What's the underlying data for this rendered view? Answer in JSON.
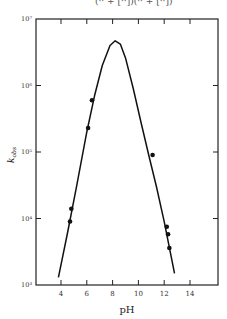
{
  "header": {
    "cropped_equation": "(·· + [··])(·· + [··])"
  },
  "chart_data": {
    "type": "line",
    "title": "",
    "xlabel": "pH",
    "ylabel": "k_obs",
    "xlim": [
      2.2,
      16
    ],
    "ylim": [
      1000,
      10000000
    ],
    "yscale": "log",
    "xticks": [
      4,
      6,
      8,
      10,
      12,
      14
    ],
    "yticks": [
      1000,
      10000,
      100000,
      1000000,
      10000000
    ],
    "ytick_labels": [
      "10³",
      "10⁴",
      "10⁵",
      "10⁶",
      "10⁷"
    ],
    "grid": false,
    "series": [
      {
        "name": "fit",
        "kind": "line",
        "x": [
          3.8,
          4.5,
          5.2,
          6.0,
          6.6,
          7.2,
          7.8,
          8.2,
          8.6,
          9.0,
          9.6,
          10.2,
          10.8,
          11.4,
          12.0,
          12.8
        ],
        "y": [
          1300,
          6000,
          30000,
          200000,
          700000,
          2000000,
          4000000,
          4700000,
          4200000,
          2600000,
          900000,
          280000,
          90000,
          30000,
          9000,
          1500
        ]
      },
      {
        "name": "data",
        "kind": "scatter",
        "x": [
          4.7,
          4.8,
          6.1,
          6.4,
          11.1,
          12.2,
          12.3,
          12.4
        ],
        "y": [
          9000,
          14000,
          230000,
          600000,
          90000,
          7500,
          5800,
          3600
        ]
      }
    ]
  }
}
